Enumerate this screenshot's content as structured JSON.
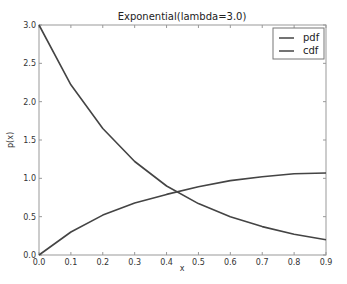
{
  "chart_data": {
    "type": "line",
    "title": "Exponential(lambda=3.0)",
    "xlabel": "x",
    "ylabel": "p(x)",
    "xlim": [
      0.0,
      0.9
    ],
    "ylim": [
      0.0,
      3.0
    ],
    "grid": false,
    "legend_position": "upper right",
    "x": [
      0.0,
      0.1,
      0.2,
      0.3,
      0.4,
      0.5,
      0.6,
      0.7,
      0.8,
      0.9
    ],
    "x_ticks": [
      "0.0",
      "0.1",
      "0.2",
      "0.3",
      "0.4",
      "0.5",
      "0.6",
      "0.7",
      "0.8",
      "0.9"
    ],
    "y_ticks": [
      "0.0",
      "0.5",
      "1.0",
      "1.5",
      "2.0",
      "2.5",
      "3.0"
    ],
    "series": [
      {
        "name": "pdf",
        "color": "#444444",
        "values": [
          3.0,
          2.22,
          1.65,
          1.22,
          0.9,
          0.67,
          0.5,
          0.37,
          0.27,
          0.2
        ]
      },
      {
        "name": "cdf",
        "color": "#444444",
        "values": [
          0.0,
          0.3,
          0.52,
          0.68,
          0.79,
          0.89,
          0.97,
          1.02,
          1.06,
          1.07
        ]
      }
    ]
  }
}
